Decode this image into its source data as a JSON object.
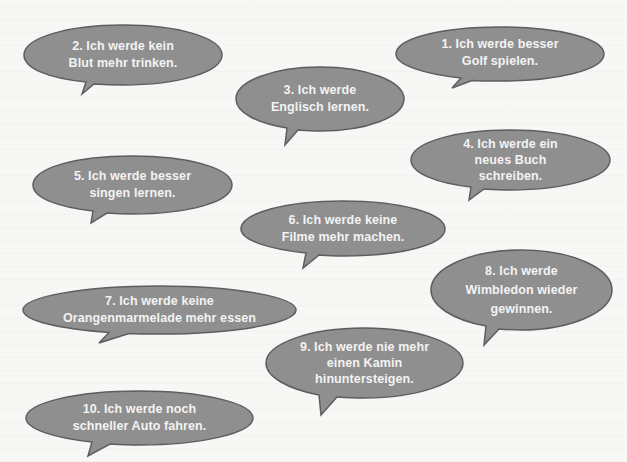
{
  "colors": {
    "background": "#f7f7f5",
    "bubble_fill": "#8f8f8f",
    "bubble_stroke": "#5e5e5e",
    "text": "#f3f3f3"
  },
  "bubbles": [
    {
      "id": 1,
      "lines": [
        "1. Ich werde besser",
        "Golf spielen."
      ]
    },
    {
      "id": 2,
      "lines": [
        "2. Ich werde kein",
        "Blut mehr trinken."
      ]
    },
    {
      "id": 3,
      "lines": [
        "3. Ich werde",
        "Englisch lernen."
      ]
    },
    {
      "id": 4,
      "lines": [
        "4. Ich werde ein",
        "neues Buch",
        "schreiben."
      ]
    },
    {
      "id": 5,
      "lines": [
        "5. Ich werde besser",
        "singen lernen."
      ]
    },
    {
      "id": 6,
      "lines": [
        "6. Ich werde keine",
        "Filme mehr machen."
      ]
    },
    {
      "id": 7,
      "lines": [
        "7. Ich werde keine",
        "Orangenmarmelade mehr essen"
      ]
    },
    {
      "id": 8,
      "lines": [
        "8. Ich werde",
        "Wimbledon wieder",
        "gewinnen."
      ]
    },
    {
      "id": 9,
      "lines": [
        "9. Ich werde nie mehr",
        "einen Kamin",
        "hinuntersteigen."
      ]
    },
    {
      "id": 10,
      "lines": [
        "10. Ich werde noch",
        "schneller Auto fahren."
      ]
    }
  ]
}
